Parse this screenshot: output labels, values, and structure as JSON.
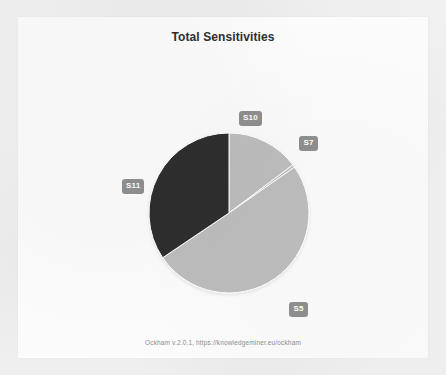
{
  "card": {
    "title": "Total Sensitivities",
    "footer": "Ockham v.2.0.1, https://knowledgeminer.eu/ockham"
  },
  "labels": {
    "s10": "S10",
    "s7": "S7",
    "s11": "S11",
    "s5": "S5"
  },
  "colors": {
    "slice_light": "#bdbdbd",
    "slice_dark": "#2e2e2e",
    "slice_edge": "#ffffff",
    "badge_bg": "#8f8f8f",
    "badge_text": "#ffffff",
    "card_bg": "#fbfbfb",
    "page_bg": "#f3f3f3",
    "title_text": "#2f2f2f",
    "footer_text": "#8d8d8d"
  },
  "chart_data": {
    "type": "pie",
    "title": "Total Sensitivities",
    "xlabel": "",
    "ylabel": "",
    "legend": "none",
    "labels_position": "outside-callout-badges",
    "categories": [
      "S10",
      "S7",
      "S5",
      "S11"
    ],
    "values": [
      14.7,
      0.6,
      50.3,
      34.4
    ],
    "value_unit": "percent",
    "start_angle_deg": 0,
    "direction": "clockwise",
    "slice_colors": [
      "#bdbdbd",
      "#bdbdbd",
      "#bdbdbd",
      "#2e2e2e"
    ],
    "slices": [
      {
        "name": "S10",
        "value": 14.7,
        "start_deg": 0.0,
        "end_deg": 53.0,
        "color": "#bdbdbd"
      },
      {
        "name": "S7",
        "value": 0.6,
        "start_deg": 53.0,
        "end_deg": 55.0,
        "color": "#bdbdbd"
      },
      {
        "name": "S5",
        "value": 50.3,
        "start_deg": 55.0,
        "end_deg": 236.0,
        "color": "#bdbdbd"
      },
      {
        "name": "S11",
        "value": 34.4,
        "start_deg": 236.0,
        "end_deg": 360.0,
        "color": "#2e2e2e"
      }
    ],
    "geometry": {
      "center_x": 211,
      "center_y": 196,
      "radius": 80
    }
  }
}
